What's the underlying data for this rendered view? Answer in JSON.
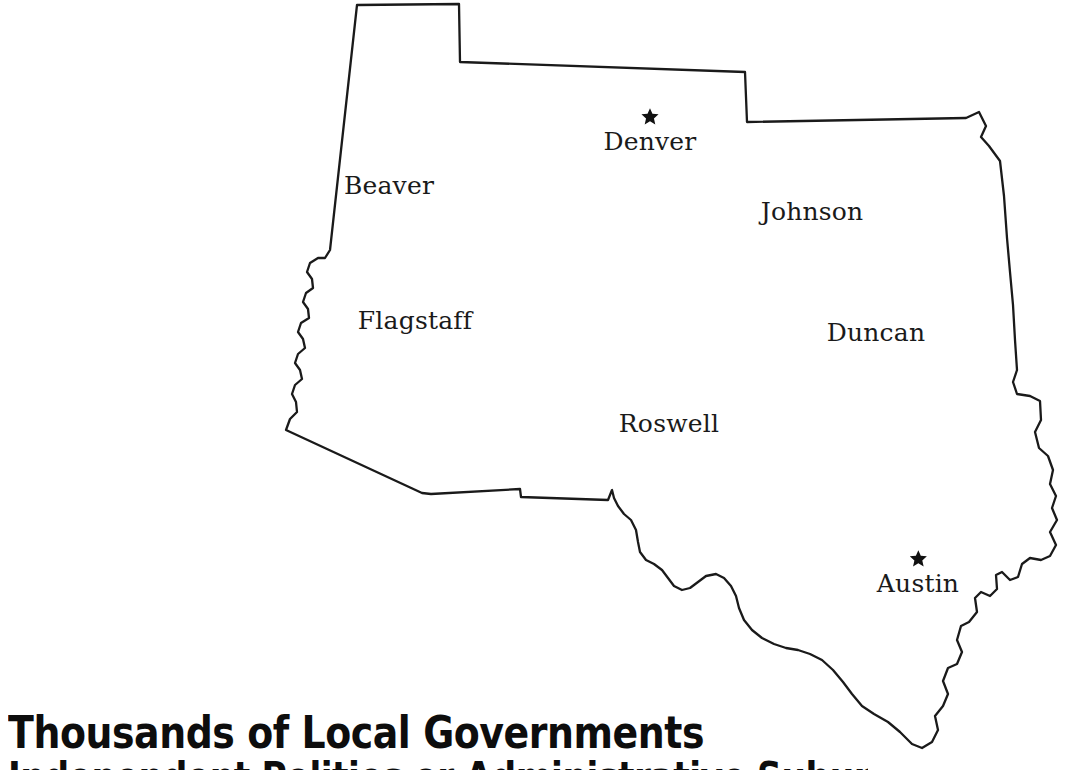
{
  "page": {
    "background_color": "#ffffff",
    "width": 1075,
    "height": 770
  },
  "title": {
    "line1": "Thousands of Local Governments",
    "line2": "Independent Polities or Administrative Subunits?"
  },
  "map": {
    "name": "southwestern-united-states-outline",
    "outline_color": "#1a1a1a",
    "fill_color": "#ffffff",
    "marker_color": "#111111",
    "label_color": "#1a1a1a",
    "cities": [
      {
        "name": "Denver",
        "marker": "star-icon",
        "marker_type": "star",
        "x": 652,
        "y": 120,
        "label_x": 650,
        "label_y": 128
      },
      {
        "name": "Beaver",
        "marker": "dot-icon",
        "marker_type": "dot",
        "x": 392,
        "y": 177,
        "label_x": 389,
        "label_y": 185
      },
      {
        "name": "Johnson",
        "marker": "dot-icon",
        "marker_type": "dot",
        "x": 815,
        "y": 203,
        "label_x": 812,
        "label_y": 211
      },
      {
        "name": "Flagstaff",
        "marker": "dot-icon",
        "marker_type": "dot",
        "x": 418,
        "y": 312,
        "label_x": 415,
        "label_y": 320
      },
      {
        "name": "Duncan",
        "marker": "dot-icon",
        "marker_type": "dot",
        "x": 879,
        "y": 324,
        "label_x": 876,
        "label_y": 332
      },
      {
        "name": "Roswell",
        "marker": "dot-icon",
        "marker_type": "dot",
        "x": 671,
        "y": 415,
        "label_x": 669,
        "label_y": 423
      },
      {
        "name": "Austin",
        "marker": "star-icon",
        "marker_type": "star",
        "x": 919,
        "y": 562,
        "label_x": 918,
        "label_y": 570
      }
    ]
  }
}
